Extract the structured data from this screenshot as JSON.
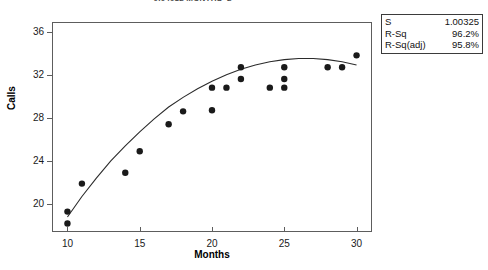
{
  "chart_data": {
    "type": "scatter",
    "title": "- 0.04012 MONTHS^2",
    "xlabel": "Months",
    "ylabel": "Calls",
    "xlim": [
      9,
      31
    ],
    "ylim": [
      17.6,
      36.9
    ],
    "xticks": [
      10,
      15,
      20,
      25,
      30
    ],
    "yticks": [
      20,
      24,
      28,
      32,
      36
    ],
    "grid": false,
    "legend": "none",
    "marker_color": "#1a1a1a",
    "line_color": "#2b2b2b",
    "points": [
      {
        "x": 10,
        "y": 19.4
      },
      {
        "x": 10,
        "y": 18.3
      },
      {
        "x": 11,
        "y": 22.0
      },
      {
        "x": 14,
        "y": 23.0
      },
      {
        "x": 15,
        "y": 25.0
      },
      {
        "x": 17,
        "y": 27.5
      },
      {
        "x": 18,
        "y": 28.7
      },
      {
        "x": 20,
        "y": 28.8
      },
      {
        "x": 20,
        "y": 30.9
      },
      {
        "x": 21,
        "y": 30.9
      },
      {
        "x": 22,
        "y": 32.8
      },
      {
        "x": 22,
        "y": 31.7
      },
      {
        "x": 24,
        "y": 30.9
      },
      {
        "x": 25,
        "y": 32.8
      },
      {
        "x": 25,
        "y": 31.7
      },
      {
        "x": 25,
        "y": 30.9
      },
      {
        "x": 28,
        "y": 32.8
      },
      {
        "x": 29,
        "y": 32.8
      },
      {
        "x": 30,
        "y": 33.9
      }
    ],
    "fit_curve": {
      "name": "quadratic-regression-fit",
      "equation_visible": "- 0.04012 MONTHS^2",
      "points": [
        {
          "x": 10.0,
          "y": 18.9
        },
        {
          "x": 11.0,
          "y": 20.8
        },
        {
          "x": 12.0,
          "y": 22.5
        },
        {
          "x": 13.0,
          "y": 24.1
        },
        {
          "x": 14.0,
          "y": 25.5
        },
        {
          "x": 15.0,
          "y": 26.8
        },
        {
          "x": 16.0,
          "y": 28.0
        },
        {
          "x": 17.0,
          "y": 29.1
        },
        {
          "x": 18.0,
          "y": 30.0
        },
        {
          "x": 19.0,
          "y": 30.8
        },
        {
          "x": 20.0,
          "y": 31.5
        },
        {
          "x": 21.0,
          "y": 32.1
        },
        {
          "x": 22.0,
          "y": 32.6
        },
        {
          "x": 23.0,
          "y": 33.0
        },
        {
          "x": 24.0,
          "y": 33.3
        },
        {
          "x": 25.0,
          "y": 33.5
        },
        {
          "x": 26.0,
          "y": 33.6
        },
        {
          "x": 27.0,
          "y": 33.6
        },
        {
          "x": 28.0,
          "y": 33.5
        },
        {
          "x": 29.0,
          "y": 33.3
        },
        {
          "x": 30.0,
          "y": 33.0
        }
      ]
    }
  },
  "stats": {
    "rows": [
      {
        "key": "S",
        "value": "1.00325"
      },
      {
        "key": "R-Sq",
        "value": "96.2%"
      },
      {
        "key": "R-Sq(adj)",
        "value": "95.8%"
      }
    ]
  }
}
